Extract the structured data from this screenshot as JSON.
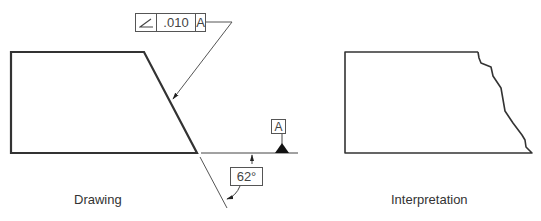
{
  "drawing": {
    "caption": "Drawing",
    "feature_control_frame": {
      "symbol": "angularity-icon",
      "tolerance": ".010",
      "datum": "A"
    },
    "datum_feature": {
      "label": "A"
    },
    "angle_dimension": {
      "value": "62°"
    }
  },
  "interpretation": {
    "caption": "Interpretation"
  },
  "colors": {
    "outline": "#333333",
    "thin_line": "#555555",
    "text": "#444444"
  }
}
